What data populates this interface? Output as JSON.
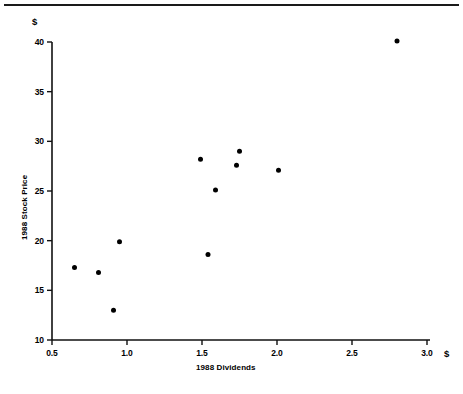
{
  "chart_data": {
    "type": "scatter",
    "title": "",
    "xlabel": "1988 Dividends",
    "ylabel": "1988 Stock Price",
    "x_unit_symbol": "$",
    "y_unit_symbol": "$",
    "xlim": [
      0.5,
      3.0
    ],
    "ylim": [
      10,
      40
    ],
    "xticks": [
      "0.5",
      "1.0",
      "1.5",
      "2.0",
      "2.5",
      "3.0"
    ],
    "xtick_values": [
      0.5,
      1.0,
      1.5,
      2.0,
      2.5,
      3.0
    ],
    "yticks": [
      "10",
      "15",
      "20",
      "25",
      "30",
      "35",
      "40"
    ],
    "ytick_values": [
      10,
      15,
      20,
      25,
      30,
      35,
      40
    ],
    "grid": false,
    "legend": null,
    "marker": {
      "shape": "filled-circle",
      "color": "#000000",
      "size_px": 5
    },
    "points": [
      {
        "x": 0.65,
        "y": 17.3
      },
      {
        "x": 0.81,
        "y": 16.8
      },
      {
        "x": 0.91,
        "y": 13.0
      },
      {
        "x": 0.95,
        "y": 19.9
      },
      {
        "x": 1.49,
        "y": 28.2
      },
      {
        "x": 1.54,
        "y": 18.6
      },
      {
        "x": 1.59,
        "y": 25.1
      },
      {
        "x": 1.73,
        "y": 27.6
      },
      {
        "x": 1.75,
        "y": 29.0
      },
      {
        "x": 2.01,
        "y": 27.1
      },
      {
        "x": 2.8,
        "y": 40.1
      }
    ]
  },
  "figure": {
    "axis_color": "#111111",
    "background": "#ffffff"
  }
}
